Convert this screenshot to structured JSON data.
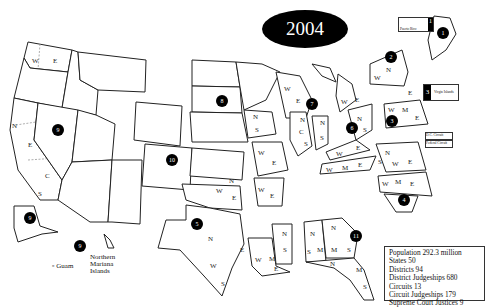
{
  "title": {
    "year": "2004"
  },
  "stats": {
    "population": "Population 292.3 million",
    "states": "States 50",
    "districts": "Districts 94",
    "district_judgeships": "District Judgeships 680",
    "circuits": "Circuits 13",
    "circuit_judgeships": "Circuit Judgeships 179",
    "supreme_court": "Supreme Court Justices 9"
  },
  "insets": {
    "puerto_rico": {
      "label": "Puerto Rico",
      "circuit": "1"
    },
    "virgin_islands": {
      "label": "Virgin Islands",
      "circuit": "3"
    },
    "dc_circuit": "D.C. Circuit",
    "federal_circuit": "Federal Circuit"
  },
  "territories": {
    "guam": "Guam",
    "nmi": "Northern Mariana Islands"
  },
  "circuits": [
    "1",
    "2",
    "3",
    "4",
    "5",
    "6",
    "7",
    "8",
    "9",
    "10",
    "11"
  ]
}
